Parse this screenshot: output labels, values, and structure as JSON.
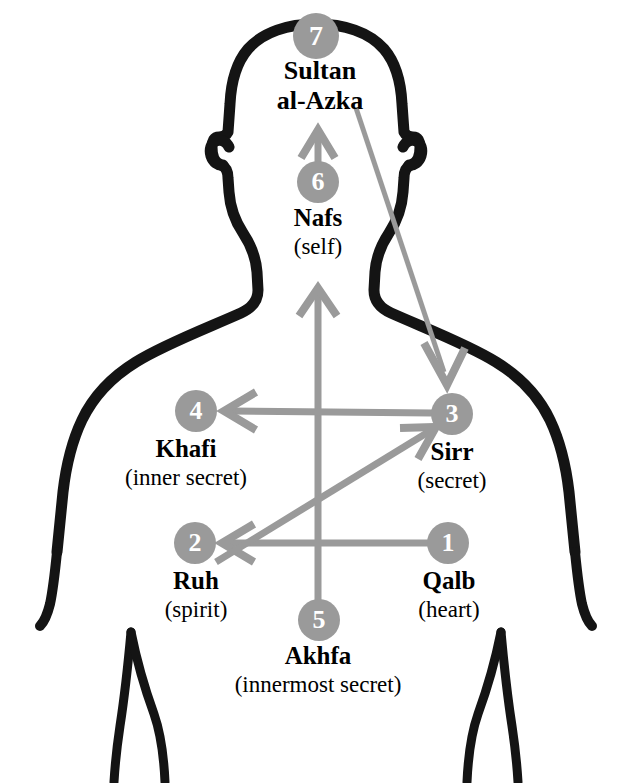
{
  "diagram": {
    "type": "anatomical-flow-diagram",
    "colors": {
      "body_outline": "#141414",
      "badge_fill": "#9a9a9a",
      "badge_text": "#ffffff",
      "arrow": "#9a9a9a",
      "label_text": "#000000",
      "background": "#ffffff"
    },
    "nodes": [
      {
        "number": "1",
        "name": "Qalb",
        "meaning": "(heart)",
        "badge_x": 448,
        "badge_y": 543,
        "label_x": 448,
        "label_y": 562,
        "name_size": 24,
        "meaning_size": 22
      },
      {
        "number": "2",
        "name": "Ruh",
        "meaning": "(spirit)",
        "badge_x": 195,
        "badge_y": 543,
        "label_x": 195,
        "label_y": 562,
        "name_size": 24,
        "meaning_size": 22
      },
      {
        "number": "3",
        "name": "Sirr",
        "meaning": "(secret)",
        "badge_x": 452,
        "badge_y": 414,
        "label_x": 452,
        "label_y": 433,
        "name_size": 24,
        "meaning_size": 22
      },
      {
        "number": "4",
        "name": "Khafi",
        "meaning": "(inner secret)",
        "badge_x": 196,
        "badge_y": 411,
        "label_x": 190,
        "label_y": 430,
        "name_size": 24,
        "meaning_size": 22
      },
      {
        "number": "5",
        "name": "Akhfa",
        "meaning": "(innermost secret)",
        "badge_x": 318,
        "badge_y": 620,
        "label_x": 318,
        "label_y": 639,
        "name_size": 24,
        "meaning_size": 22
      },
      {
        "number": "6",
        "name": "Nafs",
        "meaning": "(self)",
        "badge_x": 318,
        "badge_y": 182,
        "label_x": 318,
        "label_y": 201,
        "name_size": 24,
        "meaning_size": 22
      },
      {
        "number": "7",
        "name": "Sultan al-Azka",
        "name_line1": "Sultan",
        "name_line2": "al-Azka",
        "meaning": "",
        "badge_x": 316,
        "badge_y": 36,
        "label_x": 320,
        "label_y": 56,
        "name_size": 26,
        "meaning_size": 22
      }
    ],
    "arrows": [
      {
        "from": "1",
        "to": "2",
        "kind": "horizontal-left"
      },
      {
        "from": "2",
        "to": "3",
        "kind": "diagonal-up-right"
      },
      {
        "from": "3",
        "to": "4",
        "kind": "horizontal-left"
      },
      {
        "from": "5",
        "to": "6",
        "kind": "vertical-up"
      },
      {
        "from": "6",
        "to": "7",
        "kind": "short-vertical-up"
      },
      {
        "from": "7",
        "to": "3",
        "kind": "long-diagonal-down-right"
      }
    ]
  }
}
